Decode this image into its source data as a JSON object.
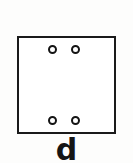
{
  "figure": {
    "panel_label": "d",
    "background_color": "#fdfdfc",
    "stroke_color": "#1a1a1a",
    "fill_color": "#ffffff",
    "plate": {
      "name": "square-plate-outline",
      "shape": "square",
      "x": 17,
      "y": 36,
      "width": 99,
      "height": 98,
      "border_width": 2.5
    },
    "holes": [
      {
        "name": "hole-top-left",
        "x": 53,
        "y": 50,
        "diameter": 9
      },
      {
        "name": "hole-top-right",
        "x": 76,
        "y": 50,
        "diameter": 9
      },
      {
        "name": "hole-bottom-left",
        "x": 53,
        "y": 121,
        "diameter": 9
      },
      {
        "name": "hole-bottom-right",
        "x": 76,
        "y": 121,
        "diameter": 9
      }
    ],
    "hole_count": 4
  }
}
